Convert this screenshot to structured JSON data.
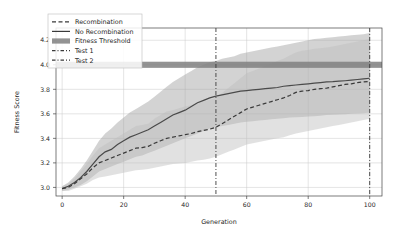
{
  "chart_data": {
    "type": "line",
    "title": "",
    "xlabel": "Generation",
    "ylabel": "Fitness Score",
    "xlim": [
      -2,
      104
    ],
    "ylim": [
      2.93,
      4.3
    ],
    "xticks": [
      0,
      20,
      40,
      60,
      80,
      100
    ],
    "yticks": [
      3.0,
      3.2,
      3.4,
      3.6,
      3.8,
      4.0,
      4.2
    ],
    "xticklabels": [
      "0",
      "20",
      "40",
      "60",
      "80",
      "100"
    ],
    "yticklabels": [
      "3.0",
      "3.2",
      "3.4",
      "3.6",
      "3.8",
      "4.0",
      "4.2"
    ],
    "grid": true,
    "legend_position": "upper left",
    "colors": {
      "recombination": "#3a3a3a",
      "no_recombination": "#4a4a4a",
      "band_recombination": "#bdbdbd",
      "band_no_recombination": "#9e9e9e",
      "fitness_threshold": "#808080",
      "test1": "#3a3a3a",
      "test2": "#3a3a3a",
      "grid": "#c8c8c8",
      "background": "#ffffff"
    },
    "x": [
      0,
      2,
      4,
      6,
      8,
      10,
      12,
      14,
      16,
      18,
      20,
      22,
      24,
      26,
      28,
      30,
      32,
      34,
      36,
      38,
      40,
      42,
      44,
      46,
      48,
      50,
      52,
      54,
      56,
      58,
      60,
      62,
      64,
      66,
      68,
      70,
      72,
      74,
      76,
      78,
      80,
      82,
      84,
      86,
      88,
      90,
      92,
      94,
      96,
      98,
      100
    ],
    "series": [
      {
        "name": "No Recombination",
        "style": "solid",
        "values": [
          2.99,
          3.01,
          3.04,
          3.08,
          3.13,
          3.19,
          3.25,
          3.29,
          3.31,
          3.35,
          3.38,
          3.41,
          3.43,
          3.45,
          3.47,
          3.5,
          3.53,
          3.56,
          3.59,
          3.61,
          3.63,
          3.66,
          3.69,
          3.71,
          3.73,
          3.745,
          3.755,
          3.765,
          3.775,
          3.785,
          3.79,
          3.795,
          3.8,
          3.805,
          3.81,
          3.815,
          3.825,
          3.83,
          3.835,
          3.84,
          3.845,
          3.85,
          3.855,
          3.86,
          3.862,
          3.866,
          3.87,
          3.875,
          3.88,
          3.885,
          3.89
        ],
        "band_lower": [
          2.97,
          2.98,
          3.0,
          3.02,
          3.05,
          3.09,
          3.13,
          3.15,
          3.17,
          3.19,
          3.21,
          3.23,
          3.25,
          3.26,
          3.28,
          3.3,
          3.32,
          3.34,
          3.36,
          3.38,
          3.4,
          3.42,
          3.44,
          3.46,
          3.48,
          3.49,
          3.5,
          3.51,
          3.52,
          3.53,
          3.535,
          3.54,
          3.545,
          3.55,
          3.555,
          3.56,
          3.565,
          3.57,
          3.572,
          3.575,
          3.578,
          3.58,
          3.585,
          3.59,
          3.592,
          3.594,
          3.596,
          3.6,
          3.602,
          3.605,
          3.61
        ],
        "band_upper": [
          3.01,
          3.04,
          3.09,
          3.15,
          3.22,
          3.3,
          3.38,
          3.44,
          3.48,
          3.53,
          3.57,
          3.61,
          3.64,
          3.67,
          3.7,
          3.74,
          3.78,
          3.82,
          3.86,
          3.89,
          3.92,
          3.95,
          3.98,
          4.0,
          4.02,
          4.03,
          4.05,
          4.06,
          4.07,
          4.09,
          4.1,
          4.11,
          4.12,
          4.13,
          4.14,
          4.15,
          4.16,
          4.17,
          4.18,
          4.19,
          4.2,
          4.21,
          4.215,
          4.22,
          4.225,
          4.23,
          4.235,
          4.24,
          4.245,
          4.25,
          4.26
        ]
      },
      {
        "name": "Recombination",
        "style": "dashed",
        "values": [
          2.99,
          3.0,
          3.03,
          3.07,
          3.11,
          3.16,
          3.2,
          3.22,
          3.24,
          3.26,
          3.28,
          3.3,
          3.32,
          3.325,
          3.335,
          3.36,
          3.38,
          3.4,
          3.41,
          3.42,
          3.43,
          3.44,
          3.455,
          3.465,
          3.475,
          3.49,
          3.52,
          3.55,
          3.58,
          3.61,
          3.64,
          3.655,
          3.67,
          3.685,
          3.7,
          3.715,
          3.73,
          3.75,
          3.775,
          3.785,
          3.79,
          3.8,
          3.805,
          3.81,
          3.82,
          3.83,
          3.84,
          3.845,
          3.855,
          3.86,
          3.865
        ],
        "band_lower": [
          2.97,
          2.97,
          2.99,
          3.01,
          3.03,
          3.06,
          3.08,
          3.09,
          3.1,
          3.11,
          3.12,
          3.13,
          3.14,
          3.145,
          3.15,
          3.16,
          3.17,
          3.18,
          3.19,
          3.195,
          3.2,
          3.21,
          3.22,
          3.225,
          3.235,
          3.25,
          3.27,
          3.29,
          3.31,
          3.33,
          3.35,
          3.36,
          3.37,
          3.38,
          3.39,
          3.4,
          3.41,
          3.425,
          3.44,
          3.45,
          3.46,
          3.47,
          3.48,
          3.49,
          3.5,
          3.51,
          3.52,
          3.53,
          3.54,
          3.55,
          3.56
        ],
        "band_upper": [
          3.01,
          3.03,
          3.07,
          3.13,
          3.19,
          3.26,
          3.32,
          3.35,
          3.38,
          3.41,
          3.44,
          3.47,
          3.5,
          3.51,
          3.52,
          3.56,
          3.59,
          3.62,
          3.63,
          3.645,
          3.66,
          3.67,
          3.69,
          3.7,
          3.715,
          3.73,
          3.77,
          3.81,
          3.85,
          3.89,
          3.93,
          3.95,
          3.97,
          3.99,
          4.01,
          4.03,
          4.05,
          4.075,
          4.1,
          4.115,
          4.12,
          4.13,
          4.135,
          4.14,
          4.15,
          4.16,
          4.17,
          4.18,
          4.19,
          4.2,
          4.21
        ]
      }
    ],
    "threshold": {
      "name": "Fitness Threshold",
      "value": 4.0,
      "lower": 3.975,
      "upper": 4.025
    },
    "vlines": [
      {
        "name": "Test 1",
        "x": 50
      },
      {
        "name": "Test 2",
        "x": 100
      }
    ],
    "legend": [
      {
        "label": "Recombination",
        "marker": "dashed-line"
      },
      {
        "label": "No Recombination",
        "marker": "solid-line"
      },
      {
        "label": "Fitness Threshold",
        "marker": "filled-band"
      },
      {
        "label": "Test 1",
        "marker": "dashdot-line"
      },
      {
        "label": "Test 2",
        "marker": "dashdot-line"
      }
    ]
  }
}
